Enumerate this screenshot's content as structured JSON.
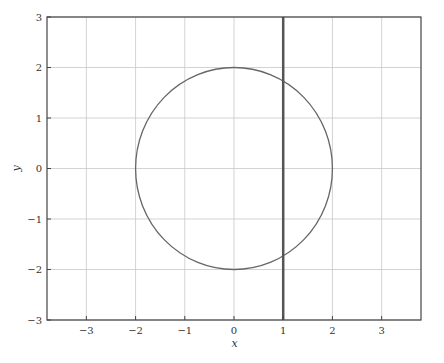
{
  "chart_data": {
    "type": "line",
    "title": "",
    "xlabel": "x",
    "ylabel": "y",
    "xlim": [
      -3.8,
      3.8
    ],
    "ylim": [
      -3,
      3
    ],
    "grid": true,
    "legend": null,
    "xticks": [
      -3,
      -2,
      -1,
      0,
      1,
      2,
      3
    ],
    "yticks": [
      -3,
      -2,
      -1,
      0,
      1,
      2,
      3
    ],
    "xtick_labels": [
      "−3",
      "−2",
      "−1",
      "0",
      "1",
      "2",
      "3"
    ],
    "ytick_labels": [
      "−3",
      "−2",
      "−1",
      "0",
      "1",
      "2",
      "3"
    ],
    "series": [
      {
        "name": "circle",
        "shape": "circle",
        "center": [
          0,
          0
        ],
        "radius": 2,
        "equation": "x^2 + y^2 = 4",
        "color": "#666666",
        "line_width": 1.3
      },
      {
        "name": "vertical-line",
        "shape": "vline",
        "x": 1,
        "equation": "x = 1",
        "color": "#555555",
        "line_width": 2.5
      }
    ],
    "colors": {
      "grid": "#c8c8c8",
      "frame": "#444444"
    }
  }
}
